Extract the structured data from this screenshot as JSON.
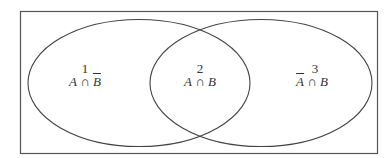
{
  "diagram": {
    "type": "venn",
    "universe": {
      "shape": "rectangle"
    },
    "sets": [
      {
        "name": "A",
        "position": "left"
      },
      {
        "name": "B",
        "position": "right"
      }
    ],
    "regions": [
      {
        "number": "1",
        "expr_left": "A",
        "op": " ∩ ",
        "expr_right": "B",
        "left_bar": false,
        "right_bar": true
      },
      {
        "number": "2",
        "expr_left": "A",
        "op": " ∩ ",
        "expr_right": "B",
        "left_bar": false,
        "right_bar": false
      },
      {
        "number": "3",
        "expr_left": "A",
        "op": " ∩ ",
        "expr_right": "B",
        "left_bar": true,
        "right_bar": false
      }
    ],
    "colors": {
      "stroke": "#444444",
      "background": "#ffffff"
    }
  }
}
